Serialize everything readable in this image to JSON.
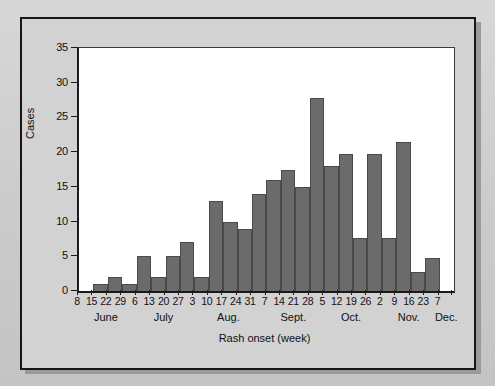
{
  "figure": {
    "background_color": "#d2d2d2",
    "plot_background_color": "#ffffff",
    "bar_color": "#6b6b6b",
    "axis_color": "#1a1a1a"
  },
  "chart_data": {
    "type": "bar",
    "title": "",
    "subtitle": "",
    "xlabel": "Rash onset (week)",
    "ylabel": "Cases",
    "ylim": [
      0,
      35
    ],
    "yticks": [
      0,
      5,
      10,
      15,
      20,
      25,
      30,
      35
    ],
    "ytick_labels": [
      "0",
      "5",
      "10",
      "15",
      "20",
      "25",
      "30",
      "35"
    ],
    "grid": false,
    "legend": null,
    "categories": [
      "8",
      "15",
      "22",
      "29",
      "6",
      "13",
      "20",
      "27",
      "3",
      "10",
      "17",
      "24",
      "31",
      "7",
      "14",
      "21",
      "28",
      "5",
      "12",
      "19",
      "26",
      "2",
      "9",
      "16",
      "23",
      "7"
    ],
    "values": [
      0,
      1,
      2,
      1,
      5,
      2,
      5,
      7,
      2,
      13,
      10,
      9,
      14,
      16,
      17.5,
      15,
      27.8,
      18,
      19.7,
      7.6,
      19.7,
      7.6,
      21.5,
      2.7,
      4.7,
      0
    ],
    "month_groups": [
      {
        "label": "June",
        "center_index": 2
      },
      {
        "label": "July",
        "center_index": 6
      },
      {
        "label": "Aug.",
        "center_index": 10.5
      },
      {
        "label": "Sept.",
        "center_index": 15
      },
      {
        "label": "Oct.",
        "center_index": 19
      },
      {
        "label": "Nov.",
        "center_index": 23
      },
      {
        "label": "Dec.",
        "center_index": 25.6
      }
    ]
  }
}
